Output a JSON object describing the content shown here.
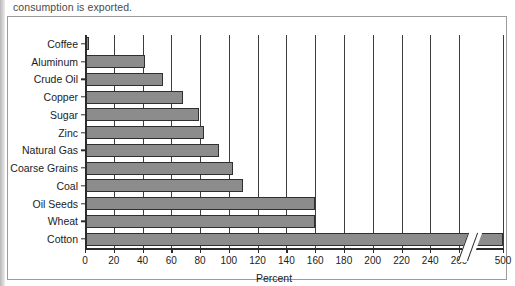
{
  "caption": "consumption is exported.",
  "chart_data": {
    "type": "bar",
    "orientation": "horizontal",
    "title": "",
    "xlabel": "Percent",
    "ylabel": "",
    "categories": [
      "Coffee",
      "Aluminum",
      "Crude Oil",
      "Copper",
      "Sugar",
      "Zinc",
      "Natural Gas",
      "Coarse Grains",
      "Coal",
      "Oil Seeds",
      "Wheat",
      "Cotton"
    ],
    "values": [
      3,
      42,
      54,
      68,
      79,
      83,
      93,
      103,
      110,
      160,
      160,
      500
    ],
    "tick_labels": [
      "0",
      "20",
      "40",
      "60",
      "80",
      "100",
      "120",
      "140",
      "160",
      "180",
      "200",
      "220",
      "240",
      "260",
      "500"
    ],
    "tick_values": [
      0,
      20,
      40,
      60,
      80,
      100,
      120,
      140,
      160,
      180,
      200,
      220,
      240,
      260,
      500
    ],
    "xlim": [
      0,
      500
    ],
    "axis_break": {
      "after": 260,
      "before": 500,
      "present": true
    },
    "grid": "vertical",
    "legend": "none",
    "bar_color": "#8c8c8c",
    "bar_border_color": "#2f2f2f",
    "axis_color": "#2b2b2b"
  }
}
